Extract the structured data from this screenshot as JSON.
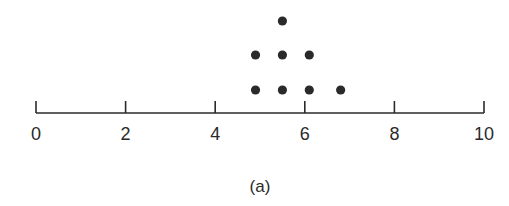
{
  "chart_data": {
    "type": "scatter",
    "subtype": "dot-plot",
    "title": "",
    "caption": "(a)",
    "xlabel": "",
    "ylabel": "",
    "xlim": [
      0,
      10
    ],
    "x_ticks": [
      0,
      2,
      4,
      6,
      8,
      10
    ],
    "x_tick_labels": [
      "0",
      "2",
      "4",
      "6",
      "8",
      "10"
    ],
    "grid": false,
    "legend": null,
    "values": [
      4.9,
      4.9,
      5.5,
      5.5,
      5.5,
      6.1,
      6.1,
      6.8
    ],
    "stacks": [
      {
        "x": 4.9,
        "count": 2
      },
      {
        "x": 5.5,
        "count": 3
      },
      {
        "x": 6.1,
        "count": 2
      },
      {
        "x": 6.8,
        "count": 1
      }
    ]
  },
  "colors": {
    "ink": "#2a2a2a",
    "background": "#ffffff"
  }
}
